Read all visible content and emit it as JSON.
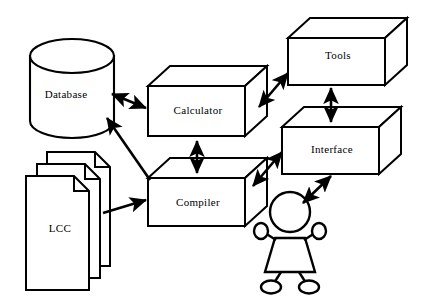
{
  "diagram": {
    "background_color": "#ffffff",
    "stroke_color": "#000000",
    "fill_color": "#ffffff",
    "nodes": [
      {
        "id": "database",
        "label": "Database",
        "shape": "cylinder"
      },
      {
        "id": "lcc",
        "label": "LCC",
        "shape": "document-stack"
      },
      {
        "id": "calculator",
        "label": "Calculator",
        "shape": "3d-box"
      },
      {
        "id": "compiler",
        "label": "Compiler",
        "shape": "3d-box"
      },
      {
        "id": "tools",
        "label": "Tools",
        "shape": "3d-box"
      },
      {
        "id": "interface",
        "label": "Interface",
        "shape": "3d-box"
      },
      {
        "id": "user",
        "label": "",
        "shape": "stick-figure"
      }
    ],
    "edges": [
      {
        "from": "database",
        "to": "calculator",
        "arrow": "double",
        "direction": "diagonal"
      },
      {
        "from": "lcc",
        "to": "database",
        "arrow": "single",
        "direction": "diagonal"
      },
      {
        "from": "lcc",
        "to": "compiler",
        "arrow": "single",
        "direction": "horizontal"
      },
      {
        "from": "calculator",
        "to": "compiler",
        "arrow": "double",
        "direction": "vertical"
      },
      {
        "from": "calculator",
        "to": "tools",
        "arrow": "double",
        "direction": "diagonal"
      },
      {
        "from": "compiler",
        "to": "interface",
        "arrow": "double",
        "direction": "diagonal"
      },
      {
        "from": "tools",
        "to": "interface",
        "arrow": "double",
        "direction": "vertical"
      },
      {
        "from": "user",
        "to": "interface",
        "arrow": "double",
        "direction": "diagonal"
      }
    ]
  }
}
